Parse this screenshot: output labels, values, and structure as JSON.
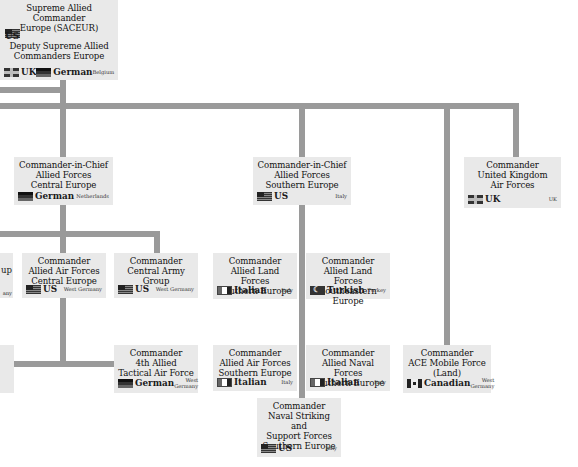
{
  "diagram": {
    "colors": {
      "connector": "#9a9a9a",
      "box": "#e9e9e9",
      "background": "#ffffff"
    },
    "top": {
      "title": "Supreme Allied Commander Europe (SACEUR)",
      "nationality": "US",
      "deputy_title": "Deputy Supreme Allied Commanders Europe",
      "deputies": [
        {
          "nationality": "UK",
          "flag": "uk-flag-icon"
        },
        {
          "nationality": "German",
          "flag": "german-flag-icon"
        }
      ],
      "location": "Belgium"
    },
    "nodes": [
      {
        "id": "cinc-central",
        "title": "Commander-in-Chief Allied Forces Central Europe",
        "nationality": "German",
        "flag": "german-flag-icon",
        "location": "Netherlands"
      },
      {
        "id": "cinc-south",
        "title": "Commander-in-Chief Allied Forces Southern Europe",
        "nationality": "US",
        "flag": "us-flag-icon",
        "location": "Italy"
      },
      {
        "id": "ukair",
        "title": "Commander United Kingdom Air Forces",
        "nationality": "UK",
        "flag": "uk-flag-icon",
        "location": "UK"
      },
      {
        "id": "partial-group",
        "title": "...up",
        "nationality": "",
        "flag": "",
        "location": "...any"
      },
      {
        "id": "aaf-central",
        "title": "Commander Allied Air Forces Central Europe",
        "nationality": "US",
        "flag": "us-flag-icon",
        "location": "West Germany"
      },
      {
        "id": "centag",
        "title": "Commander Central Army Group",
        "nationality": "US",
        "flag": "us-flag-icon",
        "location": "West Germany"
      },
      {
        "id": "alf-south",
        "title": "Commander Allied Land Forces Southern Europe",
        "nationality": "Italian",
        "flag": "italian-flag-icon",
        "location": "Italy"
      },
      {
        "id": "alf-southeast",
        "title": "Commander Allied Land Forces Southeastern Europe",
        "nationality": "Turkish",
        "flag": "turkish-flag-icon",
        "location": "Turkey"
      },
      {
        "id": "4ataf",
        "title": "Commander 4th Allied Tactical Air Force",
        "nationality": "German",
        "flag": "german-flag-icon",
        "location": "West Germany"
      },
      {
        "id": "aaf-south",
        "title": "Commander Allied Air Forces Southern Europe",
        "nationality": "Italian",
        "flag": "italian-flag-icon",
        "location": "Italy"
      },
      {
        "id": "anf-south",
        "title": "Commander Allied Naval Forces Southern Europe",
        "nationality": "Italian",
        "flag": "italian-flag-icon",
        "location": "Italy"
      },
      {
        "id": "amf",
        "title": "Commander ACE Mobile Force (Land)",
        "nationality": "Canadian",
        "flag": "canadian-flag-icon",
        "location": "West Germany"
      },
      {
        "id": "strikforsouth",
        "title": "Commander Naval Striking and Support Forces Southern Europe",
        "nationality": "US",
        "flag": "us-flag-icon",
        "location": "Italy"
      }
    ],
    "titles": {
      "sac1": "Supreme Allied Commander",
      "sac2": "Europe (SACEUR)",
      "dep1": "Deputy Supreme Allied",
      "dep2": "Commanders Europe",
      "cc1": "Commander-in-Chief",
      "cc2": "Allied Forces",
      "cc3": "Central Europe",
      "cs3": "Southern Europe",
      "cmd": "Commander",
      "uk2": "United Kingdom",
      "uk3": "Air Forces",
      "pg": "up",
      "pgloc": "any",
      "aac2": "Allied Air Forces",
      "aac3": "Central Europe",
      "cag2": "Central Army Group",
      "alf2": "Allied Land Forces",
      "alf3": "Southern Europe",
      "alse3": "Southeastern Europe",
      "at2": "4th Allied",
      "at3": "Tactical Air Force",
      "aas2": "Allied Air Forces",
      "ans2": "Allied Naval Forces",
      "amf2": "ACE Mobile Force",
      "amf3": "(Land)",
      "ns2": "Naval Striking and",
      "ns3": "Support Forces",
      "ns4": "Southern Europe",
      "wg1": "West",
      "wg2": "Germany"
    }
  }
}
